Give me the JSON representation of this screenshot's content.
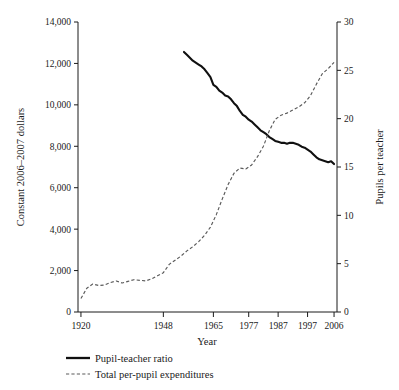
{
  "chart_data": {
    "type": "line",
    "title": "",
    "xlabel": "Year",
    "ylabel_left": "Constant 2006–2007 dollars",
    "ylabel_right": "Pupils per teacher",
    "grid": false,
    "legend_position": "below-left",
    "xlim": [
      1919,
      2007
    ],
    "x_tick_labels": [
      "1920",
      "1948",
      "1965",
      "1977",
      "1987",
      "1997",
      "2006"
    ],
    "x_tick_values": [
      1920,
      1948,
      1965,
      1977,
      1987,
      1997,
      2006
    ],
    "ylim_left": [
      0,
      14000
    ],
    "y_tick_labels_left": [
      "0",
      "2,000",
      "4,000",
      "6,000",
      "8,000",
      "10,000",
      "12,000",
      "14,000"
    ],
    "y_tick_values_left": [
      0,
      2000,
      4000,
      6000,
      8000,
      10000,
      12000,
      14000
    ],
    "ylim_right": [
      0,
      30
    ],
    "y_tick_labels_right": [
      "0",
      "5",
      "10",
      "15",
      "20",
      "25",
      "30"
    ],
    "y_tick_values_right": [
      0,
      5,
      10,
      15,
      20,
      25,
      30
    ],
    "series": [
      {
        "name": "Pupil-teacher ratio",
        "style": "solid",
        "axis": "right",
        "units": "pupils per teacher",
        "x": [
          1955,
          1956,
          1957,
          1958,
          1959,
          1960,
          1961,
          1962,
          1963,
          1964,
          1965,
          1966,
          1967,
          1968,
          1969,
          1970,
          1971,
          1972,
          1973,
          1974,
          1975,
          1976,
          1977,
          1978,
          1979,
          1980,
          1981,
          1982,
          1983,
          1984,
          1985,
          1986,
          1987,
          1988,
          1989,
          1990,
          1991,
          1992,
          1993,
          1994,
          1995,
          1996,
          1997,
          1998,
          1999,
          2000,
          2001,
          2002,
          2003,
          2004,
          2005,
          2006
        ],
        "values": [
          26.9,
          26.6,
          26.3,
          26.0,
          25.8,
          25.6,
          25.4,
          25.1,
          24.7,
          24.3,
          23.5,
          23.3,
          22.9,
          22.7,
          22.4,
          22.3,
          22.0,
          21.6,
          21.3,
          20.8,
          20.4,
          20.2,
          19.9,
          19.7,
          19.4,
          19.1,
          18.8,
          18.6,
          18.4,
          18.1,
          17.9,
          17.7,
          17.6,
          17.5,
          17.5,
          17.4,
          17.5,
          17.5,
          17.4,
          17.3,
          17.1,
          17.0,
          16.8,
          16.6,
          16.3,
          16.0,
          15.8,
          15.7,
          15.6,
          15.5,
          15.6,
          15.3
        ]
      },
      {
        "name": "Total per-pupil expenditures",
        "style": "dashed",
        "axis": "left",
        "units": "constant 2006–2007 dollars",
        "x": [
          1920,
          1922,
          1924,
          1926,
          1928,
          1930,
          1932,
          1934,
          1936,
          1938,
          1940,
          1942,
          1944,
          1946,
          1948,
          1950,
          1952,
          1954,
          1956,
          1958,
          1960,
          1962,
          1964,
          1966,
          1968,
          1970,
          1972,
          1974,
          1976,
          1978,
          1980,
          1982,
          1984,
          1986,
          1988,
          1990,
          1992,
          1994,
          1996,
          1998,
          2000,
          2002,
          2004,
          2006
        ],
        "values": [
          650,
          1150,
          1350,
          1280,
          1300,
          1420,
          1500,
          1400,
          1480,
          1560,
          1530,
          1500,
          1600,
          1750,
          1900,
          2300,
          2500,
          2700,
          2950,
          3150,
          3400,
          3700,
          4100,
          4700,
          5450,
          6150,
          6700,
          6950,
          6900,
          7100,
          7500,
          8000,
          8750,
          9300,
          9500,
          9600,
          9750,
          9900,
          10100,
          10450,
          11000,
          11500,
          11750,
          12050
        ]
      }
    ],
    "annotations": []
  },
  "legend": {
    "items": [
      {
        "label": "Pupil-teacher ratio",
        "style": "solid"
      },
      {
        "label": "Total per-pupil expenditures",
        "style": "dashed"
      }
    ]
  }
}
